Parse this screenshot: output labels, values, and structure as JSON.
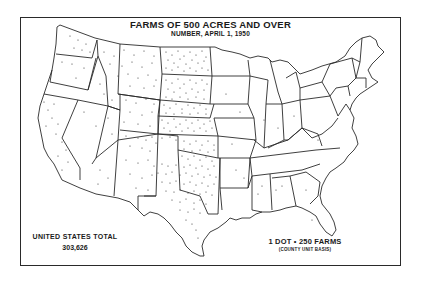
{
  "map": {
    "title": "FARMS OF 500 ACRES AND OVER",
    "subtitle": "NUMBER, APRIL 1, 1950",
    "region": "United States",
    "type": "dot-density",
    "total": {
      "label": "UNITED STATES TOTAL",
      "value": "303,626"
    },
    "legend": {
      "dot_value": "1 DOT = 250 FARMS",
      "dot_value_display": "1 DOT • 250 FARMS",
      "basis": "(COUNTY UNIT BASIS)"
    },
    "colors": {
      "background": "#ffffff",
      "lines": "#2a2a2a",
      "dots": "#333333"
    },
    "density_regions": [
      {
        "name": "North Dakota",
        "density": "very high"
      },
      {
        "name": "South Dakota",
        "density": "very high"
      },
      {
        "name": "Nebraska",
        "density": "high"
      },
      {
        "name": "Kansas",
        "density": "high"
      },
      {
        "name": "Oklahoma",
        "density": "high"
      },
      {
        "name": "Texas",
        "density": "very high"
      },
      {
        "name": "Montana",
        "density": "medium"
      },
      {
        "name": "Wyoming",
        "density": "medium"
      },
      {
        "name": "Colorado",
        "density": "medium"
      },
      {
        "name": "New Mexico",
        "density": "medium"
      },
      {
        "name": "Washington",
        "density": "medium"
      },
      {
        "name": "California",
        "density": "medium"
      },
      {
        "name": "Eastern states",
        "density": "low"
      }
    ]
  }
}
